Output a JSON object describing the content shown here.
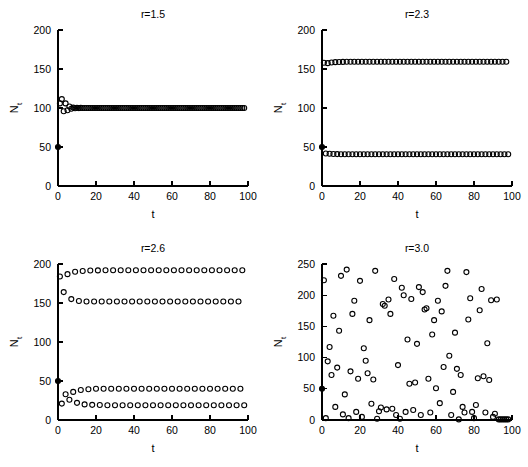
{
  "figure": {
    "width": 528,
    "height": 467,
    "background": "#ffffff",
    "ink": "#000000",
    "marker_style": "open-circle",
    "initial_marker_style": "filled-circle"
  },
  "chart_data": [
    {
      "type": "scatter",
      "panel": 1,
      "title": "r=1.5",
      "xlabel": "t",
      "ylabel": "N_t",
      "ylabel_display": "N",
      "ylabel_subscript": "t",
      "xlim": [
        0,
        100
      ],
      "ylim": [
        0,
        200
      ],
      "xticks": [
        0,
        20,
        40,
        60,
        80,
        100
      ],
      "yticks": [
        0,
        50,
        100,
        150,
        200
      ],
      "grid": false,
      "legend": "none",
      "model": "ricker",
      "r": 1.5,
      "K": 100,
      "N0": 50,
      "n_points": 99,
      "behavior": "damped oscillation to stable fixed point at N=100",
      "x": [
        0,
        1,
        2,
        3,
        4,
        5,
        6,
        7,
        8,
        9,
        10,
        11,
        12,
        13,
        14,
        15,
        16,
        17,
        18,
        19,
        20,
        21,
        22,
        23,
        24,
        25,
        26,
        27,
        28,
        29,
        30,
        31,
        32,
        33,
        34,
        35,
        36,
        37,
        38,
        39,
        40,
        41,
        42,
        43,
        44,
        45,
        46,
        47,
        48,
        49,
        50,
        51,
        52,
        53,
        54,
        55,
        56,
        57,
        58,
        59,
        60,
        61,
        62,
        63,
        64,
        65,
        66,
        67,
        68,
        69,
        70,
        71,
        72,
        73,
        74,
        75,
        76,
        77,
        78,
        79,
        80,
        81,
        82,
        83,
        84,
        85,
        86,
        87,
        88,
        89,
        90,
        91,
        92,
        93,
        94,
        95,
        96,
        97,
        98
      ],
      "y": [
        50.0,
        105.9,
        111.4,
        95.8,
        105.9,
        97.1,
        101.9,
        99.1,
        100.5,
        99.7,
        100.2,
        99.9,
        100.1,
        100.0,
        100.0,
        100.0,
        100.0,
        100.0,
        100.0,
        100.0,
        100.0,
        100.0,
        100.0,
        100.0,
        100.0,
        100.0,
        100.0,
        100.0,
        100.0,
        100.0,
        100.0,
        100.0,
        100.0,
        100.0,
        100.0,
        100.0,
        100.0,
        100.0,
        100.0,
        100.0,
        100.0,
        100.0,
        100.0,
        100.0,
        100.0,
        100.0,
        100.0,
        100.0,
        100.0,
        100.0,
        100.0,
        100.0,
        100.0,
        100.0,
        100.0,
        100.0,
        100.0,
        100.0,
        100.0,
        100.0,
        100.0,
        100.0,
        100.0,
        100.0,
        100.0,
        100.0,
        100.0,
        100.0,
        100.0,
        100.0,
        100.0,
        100.0,
        100.0,
        100.0,
        100.0,
        100.0,
        100.0,
        100.0,
        100.0,
        100.0,
        100.0,
        100.0,
        100.0,
        100.0,
        100.0,
        100.0,
        100.0,
        100.0,
        100.0,
        100.0,
        100.0,
        100.0,
        100.0,
        100.0,
        100.0,
        100.0,
        100.0,
        100.0,
        100.0
      ]
    },
    {
      "type": "scatter",
      "panel": 2,
      "title": "r=2.3",
      "xlabel": "t",
      "ylabel": "N_t",
      "ylabel_display": "N",
      "ylabel_subscript": "t",
      "xlim": [
        0,
        100
      ],
      "ylim": [
        0,
        200
      ],
      "xticks": [
        0,
        20,
        40,
        60,
        80,
        100
      ],
      "yticks": [
        0,
        50,
        100,
        150,
        200
      ],
      "grid": false,
      "legend": "none",
      "model": "ricker",
      "r": 2.3,
      "K": 100,
      "N0": 50,
      "n_points": 99,
      "behavior": "period-2 limit cycle between N=159 and N=41",
      "cycle_values": [
        159,
        41
      ],
      "x": [
        0,
        1,
        2,
        3,
        4,
        5,
        6,
        7,
        8,
        9,
        10,
        11,
        12,
        13,
        14,
        15,
        16,
        17,
        18,
        19,
        20,
        21,
        22,
        23,
        24,
        25,
        26,
        27,
        28,
        29,
        30,
        31,
        32,
        33,
        34,
        35,
        36,
        37,
        38,
        39,
        40,
        41,
        42,
        43,
        44,
        45,
        46,
        47,
        48,
        49,
        50,
        51,
        52,
        53,
        54,
        55,
        56,
        57,
        58,
        59,
        60,
        61,
        62,
        63,
        64,
        65,
        66,
        67,
        68,
        69,
        70,
        71,
        72,
        73,
        74,
        75,
        76,
        77,
        78,
        79,
        80,
        81,
        82,
        83,
        84,
        85,
        86,
        87,
        88,
        89,
        90,
        91,
        92,
        93,
        94,
        95,
        96,
        97,
        98
      ],
      "y": [
        50.0,
        158.0,
        41.6,
        157.5,
        41.3,
        158.4,
        41.0,
        158.8,
        40.9,
        159.0,
        40.8,
        159.1,
        40.8,
        159.2,
        40.8,
        159.2,
        40.8,
        159.2,
        40.8,
        159.2,
        40.8,
        159.2,
        40.8,
        159.2,
        40.8,
        159.2,
        40.8,
        159.2,
        40.8,
        159.2,
        40.8,
        159.2,
        40.8,
        159.2,
        40.8,
        159.2,
        40.8,
        159.2,
        40.8,
        159.2,
        40.8,
        159.2,
        40.8,
        159.2,
        40.8,
        159.2,
        40.8,
        159.2,
        40.8,
        159.2,
        40.8,
        159.2,
        40.8,
        159.2,
        40.8,
        159.2,
        40.8,
        159.2,
        40.8,
        159.2,
        40.8,
        159.2,
        40.8,
        159.2,
        40.8,
        159.2,
        40.8,
        159.2,
        40.8,
        159.2,
        40.8,
        159.2,
        40.8,
        159.2,
        40.8,
        159.2,
        40.8,
        159.2,
        40.8,
        159.2,
        40.8,
        159.2,
        40.8,
        159.2,
        40.8,
        159.2,
        40.8,
        159.2,
        40.8,
        159.2,
        40.8,
        159.2,
        40.8,
        159.2,
        40.8,
        159.2,
        40.8,
        159.2,
        40.8
      ]
    },
    {
      "type": "scatter",
      "panel": 3,
      "title": "r=2.6",
      "xlabel": "t",
      "ylabel": "N_t",
      "ylabel_display": "N",
      "ylabel_subscript": "t",
      "xlim": [
        0,
        100
      ],
      "ylim": [
        0,
        200
      ],
      "xticks": [
        0,
        20,
        40,
        60,
        80,
        100
      ],
      "yticks": [
        0,
        50,
        100,
        150,
        200
      ],
      "grid": false,
      "legend": "none",
      "model": "ricker",
      "r": 2.6,
      "K": 100,
      "N0": 50,
      "n_points": 99,
      "behavior": "period-4 limit cycle with levels 192, 152, 40, 19",
      "cycle_values": [
        192,
        19,
        152,
        40
      ],
      "x": [
        0,
        1,
        2,
        3,
        4,
        5,
        6,
        7,
        8,
        9,
        10,
        11,
        12,
        13,
        14,
        15,
        16,
        17,
        18,
        19,
        20,
        21,
        22,
        23,
        24,
        25,
        26,
        27,
        28,
        29,
        30,
        31,
        32,
        33,
        34,
        35,
        36,
        37,
        38,
        39,
        40,
        41,
        42,
        43,
        44,
        45,
        46,
        47,
        48,
        49,
        50,
        51,
        52,
        53,
        54,
        55,
        56,
        57,
        58,
        59,
        60,
        61,
        62,
        63,
        64,
        65,
        66,
        67,
        68,
        69,
        70,
        71,
        72,
        73,
        74,
        75,
        76,
        77,
        78,
        79,
        80,
        81,
        82,
        83,
        84,
        85,
        86,
        87,
        88,
        89,
        90,
        91,
        92,
        93,
        94,
        95,
        96,
        97,
        98
      ],
      "y": [
        50.0,
        184.0,
        21.0,
        164.0,
        33.0,
        187.0,
        26.0,
        155.0,
        36.0,
        190.0,
        22.0,
        152.5,
        38.5,
        191.0,
        20.0,
        152.0,
        39.5,
        191.6,
        19.4,
        152.0,
        40.0,
        191.8,
        19.2,
        152.0,
        40.0,
        192.0,
        19.0,
        152.0,
        40.0,
        192.0,
        19.0,
        152.0,
        40.0,
        192.0,
        19.0,
        152.0,
        40.0,
        192.0,
        19.0,
        152.0,
        40.0,
        192.0,
        19.0,
        152.0,
        40.0,
        192.0,
        19.0,
        152.0,
        40.0,
        192.0,
        19.0,
        152.0,
        40.0,
        192.0,
        19.0,
        152.0,
        40.0,
        192.0,
        19.0,
        152.0,
        40.0,
        192.0,
        19.0,
        152.0,
        40.0,
        192.0,
        19.0,
        152.0,
        40.0,
        192.0,
        19.0,
        152.0,
        40.0,
        192.0,
        19.0,
        152.0,
        40.0,
        192.0,
        19.0,
        152.0,
        40.0,
        192.0,
        19.0,
        152.0,
        40.0,
        192.0,
        19.0,
        152.0,
        40.0,
        192.0,
        19.0,
        152.0,
        40.0,
        192.0,
        19.0,
        152.0,
        40.0,
        192.0,
        19.0
      ]
    },
    {
      "type": "scatter",
      "panel": 4,
      "title": "r=3.0",
      "xlabel": "t",
      "ylabel": "N_t",
      "ylabel_display": "N",
      "ylabel_subscript": "t",
      "xlim": [
        0,
        100
      ],
      "ylim": [
        0,
        250
      ],
      "xticks": [
        0,
        20,
        40,
        60,
        80,
        100
      ],
      "yticks": [
        0,
        50,
        100,
        150,
        200,
        250
      ],
      "grid": false,
      "legend": "none",
      "model": "ricker",
      "r": 3.0,
      "K": 100,
      "N0": 50,
      "n_points": 99,
      "behavior": "chaotic dynamics spanning N from near 0 to about 245",
      "x": [
        0,
        1,
        2,
        3,
        4,
        5,
        6,
        7,
        8,
        9,
        10,
        11,
        12,
        13,
        14,
        15,
        16,
        17,
        18,
        19,
        20,
        21,
        22,
        23,
        24,
        25,
        26,
        27,
        28,
        29,
        30,
        31,
        32,
        33,
        34,
        35,
        36,
        37,
        38,
        39,
        40,
        41,
        42,
        43,
        44,
        45,
        46,
        47,
        48,
        49,
        50,
        51,
        52,
        53,
        54,
        55,
        56,
        57,
        58,
        59,
        60,
        61,
        62,
        63,
        64,
        65,
        66,
        67,
        68,
        69,
        70,
        71,
        72,
        73,
        74,
        75,
        76,
        77,
        78,
        79,
        80,
        81,
        82,
        83,
        84,
        85,
        86,
        87,
        88,
        89,
        90,
        91,
        92,
        93,
        94,
        95,
        96,
        97,
        98
      ],
      "y": [
        50.0,
        224.0,
        3.0,
        94.0,
        117.0,
        72.0,
        167.0,
        21.0,
        84.0,
        143.0,
        231.0,
        9.0,
        41.0,
        241.0,
        3.0,
        78.0,
        170.0,
        191.0,
        13.0,
        66.0,
        223.0,
        5.0,
        115.0,
        95.0,
        75.0,
        160.0,
        26.0,
        65.0,
        239.0,
        2.0,
        14.0,
        20.0,
        186.0,
        183.0,
        17.0,
        193.0,
        170.0,
        18.0,
        226.0,
        8.0,
        88.0,
        2.0,
        212.0,
        200.0,
        13.0,
        129.0,
        58.0,
        194.0,
        16.0,
        60.0,
        122.0,
        213.0,
        8.0,
        205.0,
        177.0,
        179.0,
        66.0,
        12.0,
        137.0,
        160.0,
        51.0,
        191.0,
        27.0,
        174.0,
        85.0,
        215.0,
        239.0,
        103.0,
        8.0,
        45.0,
        140.0,
        82.0,
        1.0,
        72.0,
        21.0,
        12.0,
        237.0,
        161.0,
        195.0,
        13.0,
        3.0,
        24.0,
        67.0,
        176.0,
        210.0,
        70.0,
        12.0,
        123.0,
        64.0,
        192.0,
        5.0,
        10.0,
        193.0,
        1.0,
        1.0,
        1.0,
        1.0,
        1.0,
        1.0
      ]
    }
  ]
}
